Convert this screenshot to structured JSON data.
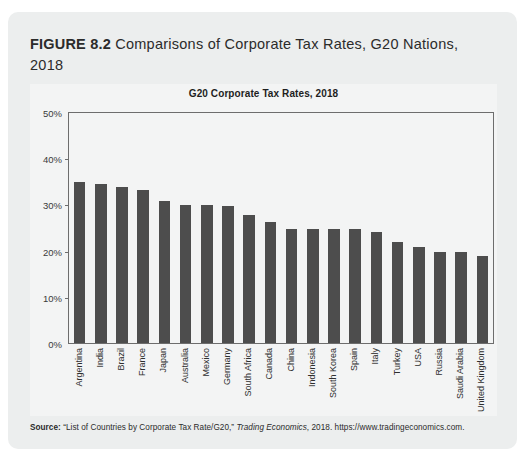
{
  "figure": {
    "label": "FIGURE 8.2",
    "caption": " Comparisons of Corporate Tax Rates, G20 Nations, 2018"
  },
  "source": {
    "label": "Source:",
    "text_before": " “List of Countries by Corporate Tax Rate/G20,” ",
    "publication": "Trading Economics",
    "text_after": ", 2018. https://www.tradingeconomics.com."
  },
  "chart_data": {
    "type": "bar",
    "title": "G20 Corporate Tax Rates, 2018",
    "xlabel": "",
    "ylabel": "",
    "ylim": [
      0,
      50
    ],
    "grid": false,
    "legend": "none",
    "ytick_labels": [
      "50%",
      "40%",
      "30%",
      "20%",
      "10%",
      "0%"
    ],
    "ytick_values": [
      50,
      40,
      30,
      20,
      10,
      0
    ],
    "categories": [
      "Argentina",
      "India",
      "Brazil",
      "France",
      "Japan",
      "Australia",
      "Mexico",
      "Germany",
      "South Africa",
      "Canada",
      "China",
      "Indonesia",
      "South Korea",
      "Spain",
      "Italy",
      "Turkey",
      "USA",
      "Russia",
      "Saudi Arabia",
      "United Kingdom"
    ],
    "values": [
      35.0,
      34.6,
      34.0,
      33.3,
      30.9,
      30.0,
      30.0,
      29.8,
      28.0,
      26.5,
      25.0,
      25.0,
      25.0,
      25.0,
      24.2,
      22.0,
      21.0,
      20.0,
      20.0,
      19.0
    ],
    "value_unit": "%",
    "bar_color": "#4d4d4d"
  }
}
